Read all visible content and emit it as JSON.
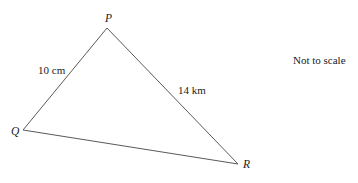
{
  "diagram": {
    "note": "Not to scale",
    "line_color": "#5a5a5a",
    "vertices": [
      {
        "id": "P",
        "label": "P",
        "x": 107,
        "y": 28
      },
      {
        "id": "Q",
        "label": "Q",
        "x": 23,
        "y": 130
      },
      {
        "id": "R",
        "label": "R",
        "x": 238,
        "y": 164
      }
    ],
    "sides": [
      {
        "from": "Q",
        "to": "P",
        "label": "10 cm"
      },
      {
        "from": "P",
        "to": "R",
        "label": "14 km"
      },
      {
        "from": "Q",
        "to": "R",
        "label": ""
      }
    ]
  }
}
